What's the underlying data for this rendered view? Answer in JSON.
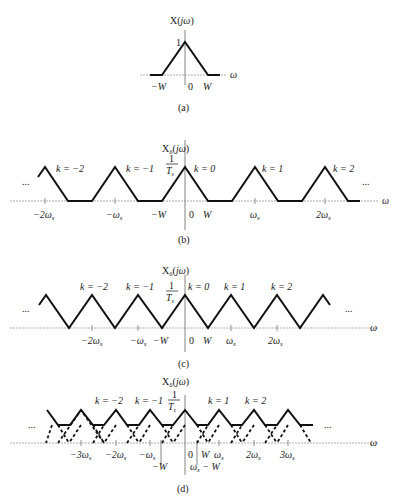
{
  "figure": {
    "panels": [
      {
        "id": "a",
        "caption": "(a)",
        "ylabel": "X(jω)",
        "peak_label": "1",
        "xlabel": "ω",
        "ticks": [
          "−W",
          "0",
          "W"
        ]
      },
      {
        "id": "b",
        "caption": "(b)",
        "ylabel": "Xδ(jω)",
        "peak_label_num": "1",
        "peak_label_den": "Ts",
        "xlabel": "ω",
        "k_labels": [
          "k = −2",
          "k = −1",
          "k = 0",
          "k = 1",
          "k = 2"
        ],
        "ticks": [
          "−2ωs",
          "−ωs",
          "−W",
          "0",
          "W",
          "ωs",
          "2ωs"
        ],
        "ellipsis": "..."
      },
      {
        "id": "c",
        "caption": "(c)",
        "ylabel": "Xδ(jω)",
        "peak_label_num": "1",
        "peak_label_den": "Ts",
        "xlabel": "ω",
        "k_labels": [
          "k = −2",
          "k = −1",
          "k = 0",
          "k = 1",
          "k = 2"
        ],
        "ticks": [
          "−2ωs",
          "−ωs",
          "−W",
          "0",
          "W",
          "ωs",
          "2ωs"
        ],
        "ellipsis": "..."
      },
      {
        "id": "d",
        "caption": "(d)",
        "ylabel": "Xδ(jω)",
        "peak_label_num": "1",
        "peak_label_den": "Ts",
        "xlabel": "ω",
        "k_labels": [
          "k = −2",
          "k = −1",
          "k = 1",
          "k = 2"
        ],
        "ticks": [
          "−3ωs",
          "−2ωs",
          "−ωs",
          "−W",
          "0",
          "W",
          "ωs",
          "2ωs",
          "3ωs",
          "ωs − W"
        ],
        "ellipsis": "..."
      }
    ]
  }
}
